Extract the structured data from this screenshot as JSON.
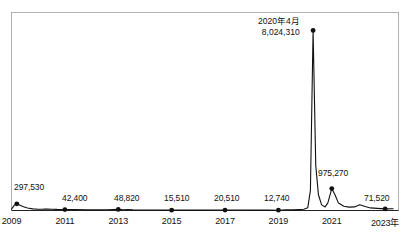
{
  "chart_data": {
    "type": "line",
    "title": "",
    "subtitle": "",
    "xlabel": "",
    "ylabel": "",
    "axis_unit_suffix": "年",
    "grid": false,
    "legend": "none",
    "xlim": [
      2009,
      2023.5
    ],
    "ylim": [
      0,
      8400000
    ],
    "x_tick_labels": [
      "2009",
      "2011",
      "2013",
      "2015",
      "2017",
      "2019",
      "2021",
      "2023年"
    ],
    "x_tick_values": [
      2009,
      2011,
      2013,
      2015,
      2017,
      2019,
      2021,
      2023
    ],
    "annotations": [
      {
        "name": "point-2009",
        "x": 2009.2,
        "value": 297530,
        "label": "297,530",
        "label_x": 14,
        "label_y": 182,
        "align": "left"
      },
      {
        "name": "point-2011",
        "x": 2011.0,
        "value": 42400,
        "label": "42,400",
        "label_x": 62,
        "label_y": 193,
        "align": "left"
      },
      {
        "name": "point-2013",
        "x": 2013.0,
        "value": 48820,
        "label": "48,820",
        "label_x": 114,
        "label_y": 193,
        "align": "left"
      },
      {
        "name": "point-2015",
        "x": 2015.0,
        "value": 15510,
        "label": "15,510",
        "label_x": 164,
        "label_y": 193,
        "align": "left"
      },
      {
        "name": "point-2017",
        "x": 2017.0,
        "value": 20510,
        "label": "20,510",
        "label_x": 214,
        "label_y": 193,
        "align": "left"
      },
      {
        "name": "point-2019",
        "x": 2019.0,
        "value": 12740,
        "label": "12,740",
        "label_x": 264,
        "label_y": 193,
        "align": "left"
      },
      {
        "name": "point-2021",
        "x": 2021.0,
        "value": 975270,
        "label": "975,270",
        "label_x": 318,
        "label_y": 168,
        "align": "left"
      },
      {
        "name": "point-2023",
        "x": 2023.0,
        "value": 71520,
        "label": "71,520",
        "label_x": 364,
        "label_y": 193,
        "align": "left"
      }
    ],
    "peak_annotation": {
      "name": "peak-2020-04",
      "date_label": "2020年4月",
      "value_label": "8,024,310",
      "value": 8024310,
      "x": 2020.3,
      "label_x": 258,
      "label_y": 16
    },
    "series": [
      {
        "name": "main-series",
        "color": "#111111",
        "points": [
          [
            2009.0,
            60000
          ],
          [
            2009.1,
            230000
          ],
          [
            2009.2,
            297530
          ],
          [
            2009.3,
            250000
          ],
          [
            2009.45,
            170000
          ],
          [
            2009.6,
            110000
          ],
          [
            2009.8,
            72000
          ],
          [
            2010.0,
            55000
          ],
          [
            2010.2,
            60000
          ],
          [
            2010.35,
            68000
          ],
          [
            2010.5,
            58000
          ],
          [
            2010.7,
            48000
          ],
          [
            2011.0,
            42400
          ],
          [
            2011.4,
            38000
          ],
          [
            2011.8,
            35000
          ],
          [
            2012.2,
            33000
          ],
          [
            2012.6,
            34000
          ],
          [
            2013.0,
            48820
          ],
          [
            2013.2,
            30000
          ],
          [
            2013.35,
            40000
          ],
          [
            2013.55,
            28000
          ],
          [
            2013.8,
            24000
          ],
          [
            2014.2,
            21000
          ],
          [
            2014.6,
            18000
          ],
          [
            2015.0,
            15510
          ],
          [
            2015.5,
            16000
          ],
          [
            2016.0,
            17000
          ],
          [
            2016.5,
            18500
          ],
          [
            2017.0,
            20510
          ],
          [
            2017.4,
            19000
          ],
          [
            2017.8,
            17500
          ],
          [
            2018.2,
            16000
          ],
          [
            2018.6,
            14500
          ],
          [
            2019.0,
            12740
          ],
          [
            2019.3,
            30000
          ],
          [
            2019.55,
            26000
          ],
          [
            2019.75,
            40000
          ],
          [
            2019.95,
            55000
          ],
          [
            2020.1,
            120000
          ],
          [
            2020.2,
            900000
          ],
          [
            2020.3,
            8024310
          ],
          [
            2020.4,
            2000000
          ],
          [
            2020.5,
            700000
          ],
          [
            2020.62,
            250000
          ],
          [
            2020.75,
            160000
          ],
          [
            2020.85,
            330000
          ],
          [
            2021.0,
            975270
          ],
          [
            2021.12,
            700000
          ],
          [
            2021.25,
            330000
          ],
          [
            2021.45,
            190000
          ],
          [
            2021.65,
            150000
          ],
          [
            2021.85,
            160000
          ],
          [
            2022.05,
            260000
          ],
          [
            2022.25,
            180000
          ],
          [
            2022.45,
            115000
          ],
          [
            2022.7,
            95000
          ],
          [
            2023.0,
            71520
          ],
          [
            2023.3,
            75000
          ]
        ]
      }
    ]
  },
  "axes": {
    "frame_color": "#aaaaaa",
    "baseline_color": "#111111"
  }
}
